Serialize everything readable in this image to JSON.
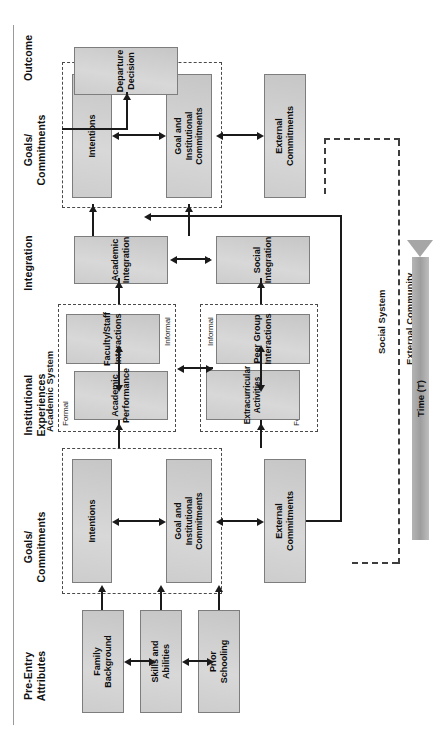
{
  "figure": {
    "type": "flow-diagram",
    "orientation": "landscape-rotated-90ccw"
  },
  "columns": [
    {
      "id": "pre-entry",
      "line1": "Pre-Entry",
      "line2": "Attributes"
    },
    {
      "id": "goals-1",
      "line1": "Goals/",
      "line2": "Commitments"
    },
    {
      "id": "institutional",
      "line1": "Institutional",
      "line2": "Experiences"
    },
    {
      "id": "integration",
      "line1": "Integration",
      "line2": ""
    },
    {
      "id": "goals-2",
      "line1": "Goals/",
      "line2": "Commitments"
    },
    {
      "id": "outcome",
      "line1": "Outcome",
      "line2": ""
    }
  ],
  "boxes": {
    "family_background": "Family\nBackground",
    "skills_abilities": "Skills and\nAbilities",
    "prior_schooling": "Prior\nSchooling",
    "intentions_1": "Intentions",
    "goal_institutional_commitments_1": "Goal and\nInstitutional\nCommitments",
    "external_commitments_1": "External\nCommitments",
    "academic_performance": "Academic\nPerformance",
    "faculty_staff_interactions": "Faculty/Staff\nInteractions",
    "extracurricular_activities": "Extracurricular\nActivities",
    "peer_group_interactions": "Peer Group\nInteractions",
    "academic_integration": "Academic\nIntegration",
    "social_integration": "Social\nIntegration",
    "intentions_2": "Intentions",
    "goal_institutional_commitments_2": "Goal and\nInstitutional\nCommitments",
    "external_commitments_2": "External\nCommitments",
    "departure_decision": "Departure\nDecision"
  },
  "group_labels": {
    "academic_system": "Academic System",
    "social_system": "Social System",
    "external_community": "External Community",
    "academic_formal": "Formal",
    "academic_informal": "Informal",
    "social_formal": "Formal",
    "social_informal": "Informal"
  },
  "time_axis": {
    "label": "Time (T)",
    "direction": "right"
  },
  "colors": {
    "box_fill": "#d2d2d2",
    "box_border": "#7d7d7d",
    "connector": "#1a1a1a",
    "dashed_frame": "#4a4a4a",
    "time_arrow": "#a6a6a6",
    "page_background": "#ffffff"
  }
}
